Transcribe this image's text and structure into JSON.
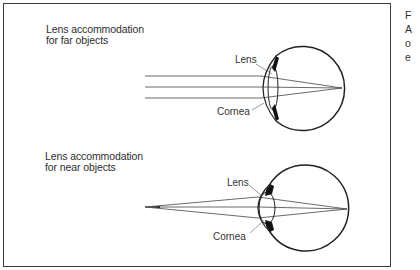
{
  "diagram": {
    "far": {
      "heading_line1": "Lens accommodation",
      "heading_line2": "for far objects",
      "label_lens": "Lens",
      "label_cornea": "Cornea"
    },
    "near": {
      "heading_line1": "Lens accommodation",
      "heading_line2": "for near objects",
      "label_lens": "Lens",
      "label_cornea": "Cornea"
    }
  },
  "side_caption": {
    "lines": [
      "F",
      "A",
      "o",
      "e"
    ]
  },
  "colors": {
    "stroke": "#2a2a2a",
    "background": "#ffffff"
  }
}
